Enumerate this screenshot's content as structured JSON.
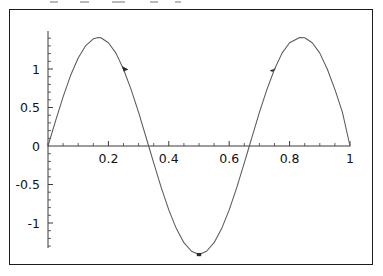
{
  "figure": {
    "kind": "mathematica-plot",
    "background_color": "#ffffff",
    "frame_color": "#1c1c1c",
    "axis_color": "#3a3a3a",
    "curve_color": "#5a5a5a",
    "marker_color": "#2a2a2a"
  },
  "chart_data": {
    "type": "line",
    "title": "",
    "subtitle": "",
    "xlabel": "",
    "ylabel": "",
    "xlim": [
      0,
      1
    ],
    "ylim": [
      -1.45,
      1.45
    ],
    "grid": false,
    "legend": null,
    "legend_position": "none",
    "x_ticks": [
      0.2,
      0.4,
      0.6,
      0.8,
      1
    ],
    "x_tick_labels": [
      "0.2",
      "0.4",
      "0.6",
      "0.8",
      "1"
    ],
    "x_minor_tick_step": 0.05,
    "y_ticks": [
      -1,
      -0.5,
      0,
      0.5,
      1
    ],
    "y_tick_labels": [
      "-1",
      "-0.5",
      "0",
      "0.5",
      "1"
    ],
    "y_minor_tick_step": 0.1,
    "axes_origin": [
      0,
      0
    ],
    "function_expression": "1.41 * sin(3 * pi * x)",
    "amplitude": 1.41,
    "period": 0.6667,
    "cycles_shown": 1.5,
    "series": [
      {
        "name": "curve",
        "x": [
          0,
          0.025,
          0.05,
          0.075,
          0.1,
          0.125,
          0.15,
          0.1667,
          0.175,
          0.2,
          0.225,
          0.25,
          0.275,
          0.3,
          0.3333,
          0.35,
          0.375,
          0.4,
          0.425,
          0.45,
          0.475,
          0.5,
          0.525,
          0.55,
          0.575,
          0.6,
          0.625,
          0.65,
          0.6667,
          0.675,
          0.7,
          0.725,
          0.75,
          0.775,
          0.8,
          0.8333,
          0.85,
          0.875,
          0.9,
          0.925,
          0.95,
          0.975,
          1
        ],
        "y": [
          0,
          0.326,
          0.637,
          0.918,
          1.142,
          1.304,
          1.392,
          1.41,
          1.406,
          1.341,
          1.206,
          0.997,
          0.736,
          0.436,
          0,
          -0.218,
          -0.54,
          -0.829,
          -1.073,
          -1.256,
          -1.367,
          -1.41,
          -1.367,
          -1.256,
          -1.073,
          -0.829,
          -0.54,
          -0.218,
          0,
          0.109,
          0.436,
          0.736,
          0.997,
          1.206,
          1.341,
          1.41,
          1.406,
          1.341,
          1.206,
          0.997,
          0.736,
          0.436,
          0
        ]
      }
    ],
    "markers": [
      {
        "label": "direction-arrow-1",
        "x": 0.255,
        "y": 1.0,
        "kind": "arrow-down-right"
      },
      {
        "label": "direction-arrow-2",
        "x": 0.745,
        "y": 1.0,
        "kind": "arrow-up-right"
      },
      {
        "label": "trough-point",
        "x": 0.5,
        "y": -1.41,
        "kind": "dot"
      }
    ]
  }
}
